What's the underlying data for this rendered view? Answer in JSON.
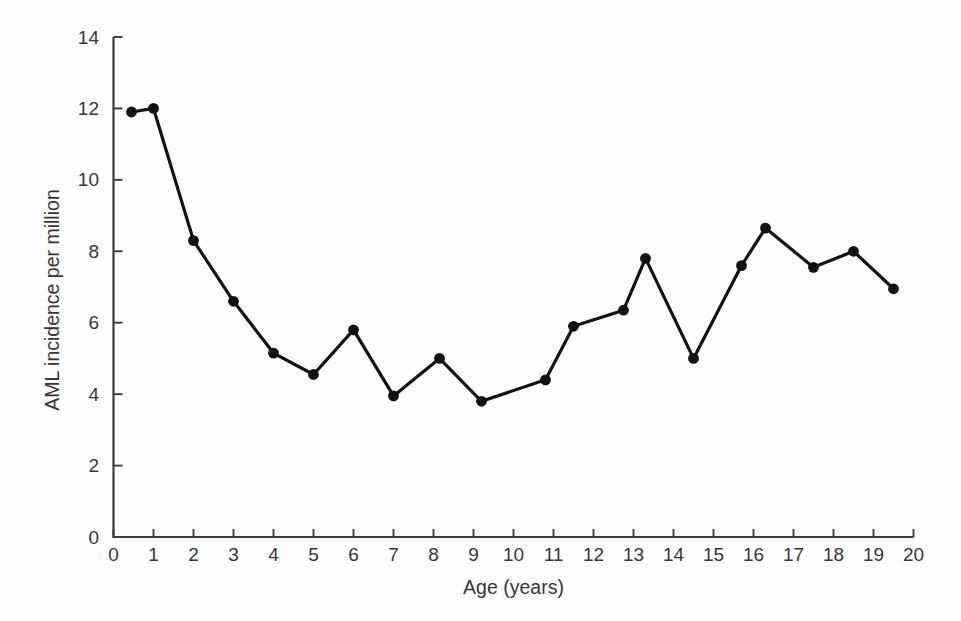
{
  "figure": {
    "background": "#fdfdfd",
    "ink_color": "#121212",
    "axis_color": "#3d3d3d",
    "text_color": "#373737"
  },
  "chart_data": {
    "type": "line",
    "title": "",
    "xlabel": "Age (years)",
    "ylabel": "AML incidence per million",
    "xlim": [
      0,
      20
    ],
    "ylim": [
      0,
      14
    ],
    "x_ticks": [
      0,
      1,
      2,
      3,
      4,
      5,
      6,
      7,
      8,
      9,
      10,
      11,
      12,
      13,
      14,
      15,
      16,
      17,
      18,
      19,
      20
    ],
    "y_ticks": [
      0,
      2,
      4,
      6,
      8,
      10,
      12,
      14
    ],
    "grid": false,
    "legend": "none",
    "series": [
      {
        "name": "AML incidence per million by age",
        "marker": "filled-circle",
        "color": "#121212",
        "x": [
          0.45,
          1,
          2,
          3,
          4,
          5,
          6,
          7,
          8.15,
          9.2,
          10.8,
          11.5,
          12.75,
          13.3,
          14.5,
          15.7,
          16.3,
          17.5,
          18.5,
          19.5
        ],
        "y": [
          11.9,
          12.0,
          8.3,
          6.6,
          5.15,
          4.55,
          5.8,
          3.95,
          5.0,
          3.8,
          4.4,
          5.9,
          6.35,
          7.8,
          5.0,
          7.6,
          8.65,
          7.55,
          8.0,
          6.95
        ]
      }
    ]
  }
}
